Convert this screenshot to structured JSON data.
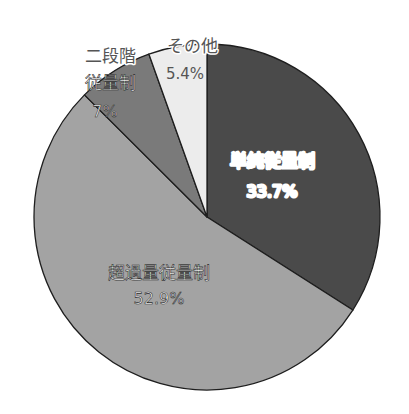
{
  "chart_data": {
    "type": "pie",
    "title": "",
    "start_angle_deg": 0,
    "direction": "clockwise",
    "slices": [
      {
        "label": "単純従量制",
        "value": 33.7,
        "display": "33.7%",
        "color": "#4a4a4a",
        "label_lines": [
          "単純従量制",
          "33.7%"
        ]
      },
      {
        "label": "超過量従量制",
        "value": 52.9,
        "display": "52.9%",
        "color": "#a3a3a3",
        "label_lines": [
          "超過量従量制",
          "52.9%"
        ]
      },
      {
        "label": "二段階従量制",
        "value": 7,
        "display": "7%",
        "color": "#7a7a7a",
        "label_lines": [
          "二段階",
          "従量制",
          "7%"
        ]
      },
      {
        "label": "その他",
        "value": 5.4,
        "display": "5.4%",
        "color": "#ececec",
        "label_lines": [
          "その他",
          "5.4%"
        ]
      }
    ],
    "legend": "none",
    "labels_on_slices": true
  }
}
